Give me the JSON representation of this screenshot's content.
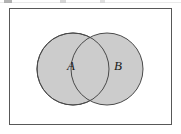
{
  "figure": {
    "name": "venn-diagram-two-sets",
    "type": "venn",
    "caption": "",
    "background_color": "#ffffff",
    "canvas": {
      "width": 181,
      "height": 134
    }
  },
  "universe_box": {
    "name": "universal-set-rectangle",
    "x": 9,
    "y": 8,
    "width": 163,
    "height": 117,
    "stroke": "#585858",
    "stroke_width": 1,
    "fill": "#ffffff",
    "label": ""
  },
  "sets": [
    {
      "id": "A",
      "label": "A",
      "shape": "circle",
      "cx": 73,
      "cy": 69,
      "r": 36,
      "fill": "#cccccc",
      "stroke": "#4a4a4a",
      "stroke_width": 1,
      "label_x": 71,
      "label_y": 67
    },
    {
      "id": "B",
      "label": "B",
      "shape": "circle",
      "cx": 107,
      "cy": 69,
      "r": 36,
      "fill": "#cccccc",
      "stroke": "#4a4a4a",
      "stroke_width": 1,
      "label_x": 118,
      "label_y": 67
    }
  ],
  "regions": {
    "intersection_shaded": true,
    "union_shaded": true,
    "complement_shaded": false,
    "intersection_fill": "#c7c7c7"
  },
  "colors": {
    "set_fill": "#cccccc",
    "set_stroke": "#4a4a4a",
    "box_stroke": "#585858",
    "label_text": "#1a1a1a",
    "page_background": "#ffffff"
  },
  "artifacts": {
    "top_rule_color": "#d9d9d9",
    "present": true
  }
}
